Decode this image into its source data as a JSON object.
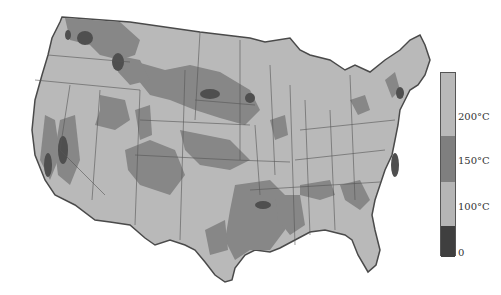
{
  "map": {
    "subject": "Contiguous United States temperature map",
    "colors": {
      "background": "#ffffff",
      "land_light": "#b9b9b9",
      "land_medium": "#8a8a8a",
      "land_dark": "#5e5e5e",
      "land_darkest": "#3a3a3a",
      "border": "#555555"
    }
  },
  "legend": {
    "bands": [
      {
        "color": "#b9b9b9",
        "range": "above 200°C"
      },
      {
        "color": "#7f7f7f",
        "range": "150–200°C"
      },
      {
        "color": "#b5b5b5",
        "range": "100–150°C"
      },
      {
        "color": "#3f3f3f",
        "range": "0–100°C"
      }
    ],
    "labels": [
      {
        "text": "200°C"
      },
      {
        "text": "150°C"
      },
      {
        "text": "100°C"
      },
      {
        "text": "0"
      }
    ]
  }
}
